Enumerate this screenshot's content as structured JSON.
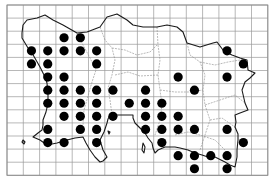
{
  "map": {
    "type": "distribution-grid-map",
    "grid": {
      "columns": 16,
      "rows": 13,
      "origin_x": 7,
      "origin_y": 5,
      "cell_width": 16.3,
      "cell_height": 13.1
    },
    "colors": {
      "grid": "#9a9a9a",
      "coastline": "#1a1a1a",
      "boundaries": "#8c8c8c",
      "dot": "#000000",
      "background": "#ffffff"
    },
    "records": [
      {
        "row": 2,
        "cols": [
          3,
          4
        ]
      },
      {
        "row": 3,
        "cols": [
          1,
          2,
          3,
          4,
          5,
          13
        ]
      },
      {
        "row": 4,
        "cols": [
          1,
          2,
          5,
          14
        ]
      },
      {
        "row": 5,
        "cols": [
          2,
          3,
          10,
          13
        ]
      },
      {
        "row": 6,
        "cols": [
          2,
          3,
          4,
          5,
          6,
          8,
          11
        ]
      },
      {
        "row": 7,
        "cols": [
          2,
          3,
          4,
          5,
          7,
          8,
          9
        ]
      },
      {
        "row": 8,
        "cols": [
          3,
          4,
          5,
          6,
          8,
          9,
          10
        ]
      },
      {
        "row": 9,
        "cols": [
          2,
          4,
          5,
          8,
          9,
          10,
          11,
          13
        ]
      },
      {
        "row": 10,
        "cols": [
          2,
          3,
          5,
          9,
          14
        ]
      },
      {
        "row": 11,
        "cols": [
          10,
          11,
          12,
          13
        ]
      },
      {
        "row": 12,
        "cols": [
          11,
          13
        ]
      }
    ]
  }
}
